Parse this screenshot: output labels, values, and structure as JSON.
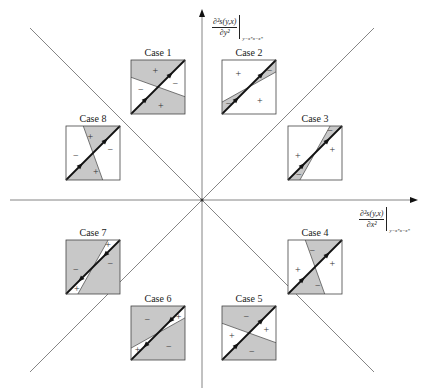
{
  "axes": {
    "y_label": {
      "numerator": "∂²s(y,x)",
      "denominator": "∂y²",
      "evaluation": "y=x*x=x*"
    },
    "x_label": {
      "numerator": "∂²s(y,x)",
      "denominator": "∂x²",
      "evaluation": "y=x*x=x*"
    }
  },
  "colors": {
    "shade": "#c8c8c8",
    "line": "#111111",
    "axis": "#555555",
    "frame": "#444444"
  },
  "cases": [
    {
      "label": "Case 1",
      "signs": [
        {
          "s": "+",
          "pos": "top"
        },
        {
          "s": "−",
          "pos": "left"
        },
        {
          "s": "−",
          "pos": "right"
        },
        {
          "s": "+",
          "pos": "bottom"
        }
      ],
      "shaded": [
        "left",
        "right"
      ],
      "second_line": "shallow-neg"
    },
    {
      "label": "Case 2",
      "signs": [
        {
          "s": "+",
          "pos": "topleft"
        },
        {
          "s": "−",
          "pos": "rightwedge"
        },
        {
          "s": "−",
          "pos": "leftwedge"
        },
        {
          "s": "+",
          "pos": "bottomright"
        }
      ],
      "shaded": [
        "wedge"
      ],
      "second_line": "shallow-pos"
    },
    {
      "label": "Case 3",
      "signs": [
        {
          "s": "+",
          "pos": "left"
        },
        {
          "s": "+",
          "pos": "right"
        },
        {
          "s": "−",
          "pos": "topwedge"
        },
        {
          "s": "−",
          "pos": "bottomwedge"
        }
      ],
      "shaded": [
        "wedge"
      ],
      "second_line": "steep-pos"
    },
    {
      "label": "Case 4",
      "signs": [
        {
          "s": "+",
          "pos": "left"
        },
        {
          "s": "−",
          "pos": "top"
        },
        {
          "s": "+",
          "pos": "right"
        },
        {
          "s": "−",
          "pos": "bottom"
        }
      ],
      "shaded": [
        "top",
        "bottom"
      ],
      "second_line": "steep-neg"
    },
    {
      "label": "Case 5",
      "signs": [
        {
          "s": "−",
          "pos": "top"
        },
        {
          "s": "+",
          "pos": "left"
        },
        {
          "s": "+",
          "pos": "right"
        },
        {
          "s": "−",
          "pos": "bottom"
        }
      ],
      "shaded": [
        "top",
        "bottom"
      ],
      "second_line": "shallow-neg"
    },
    {
      "label": "Case 6",
      "signs": [
        {
          "s": "−",
          "pos": "topleft"
        },
        {
          "s": "+",
          "pos": "rightwedge"
        },
        {
          "s": "+",
          "pos": "leftwedge"
        },
        {
          "s": "−",
          "pos": "bottomright"
        }
      ],
      "shaded": [
        "outside-wedge"
      ],
      "second_line": "shallow-pos"
    },
    {
      "label": "Case 7",
      "signs": [
        {
          "s": "−",
          "pos": "left"
        },
        {
          "s": "−",
          "pos": "right"
        },
        {
          "s": "+",
          "pos": "topwedge"
        },
        {
          "s": "+",
          "pos": "bottomwedge"
        }
      ],
      "shaded": [
        "outside-wedge"
      ],
      "second_line": "steep-pos"
    },
    {
      "label": "Case 8",
      "signs": [
        {
          "s": "−",
          "pos": "left"
        },
        {
          "s": "+",
          "pos": "top"
        },
        {
          "s": "−",
          "pos": "right"
        },
        {
          "s": "+",
          "pos": "bottom"
        }
      ],
      "shaded": [
        "left",
        "right"
      ],
      "second_line": "steep-neg"
    }
  ]
}
